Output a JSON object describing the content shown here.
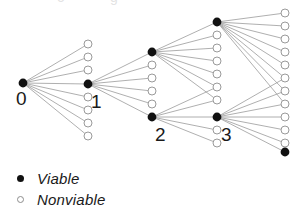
{
  "figure": {
    "type": "tree-diagram",
    "width": 293,
    "height": 217,
    "background": "#ffffff",
    "edge_color": "#9a9a9a",
    "viable_color": "#111111",
    "nonviable_stroke": "#9a9a9a",
    "nonviable_fill": "#ffffff"
  },
  "legend": {
    "items": [
      {
        "marker": "filled-dot",
        "label": "Viable"
      },
      {
        "marker": "open-dot",
        "label": "Nonviable"
      }
    ]
  },
  "node_labels": [
    {
      "text": "0",
      "x": 16,
      "y": 105
    },
    {
      "text": "1",
      "x": 91,
      "y": 108
    },
    {
      "text": "2",
      "x": 155,
      "y": 141
    },
    {
      "text": "3",
      "x": 221,
      "y": 141
    }
  ],
  "columns": [
    {
      "name": "root",
      "x": 23,
      "nodes": [
        {
          "y": 83,
          "viable": true,
          "label": "0"
        }
      ]
    },
    {
      "name": "depth-1",
      "x": 88,
      "nodes": [
        {
          "y": 44,
          "viable": false
        },
        {
          "y": 57,
          "viable": false
        },
        {
          "y": 70,
          "viable": false
        },
        {
          "y": 84,
          "viable": true,
          "label": "1"
        },
        {
          "y": 97,
          "viable": false
        },
        {
          "y": 110,
          "viable": false
        },
        {
          "y": 123,
          "viable": false
        },
        {
          "y": 136,
          "viable": false
        }
      ]
    },
    {
      "name": "depth-2",
      "x": 152,
      "nodes": [
        {
          "y": 52,
          "viable": true
        },
        {
          "y": 65,
          "viable": false
        },
        {
          "y": 78,
          "viable": false
        },
        {
          "y": 91,
          "viable": false
        },
        {
          "y": 104,
          "viable": false
        },
        {
          "y": 117,
          "viable": true,
          "label": "2"
        }
      ]
    },
    {
      "name": "depth-3",
      "x": 217,
      "nodes": [
        {
          "y": 22,
          "viable": true
        },
        {
          "y": 35,
          "viable": false
        },
        {
          "y": 48,
          "viable": false
        },
        {
          "y": 61,
          "viable": false
        },
        {
          "y": 74,
          "viable": false
        },
        {
          "y": 87,
          "viable": false
        },
        {
          "y": 100,
          "viable": false
        },
        {
          "y": 117,
          "viable": true,
          "label": "3"
        },
        {
          "y": 130,
          "viable": false
        },
        {
          "y": 143,
          "viable": false
        }
      ]
    },
    {
      "name": "depth-4",
      "x": 285,
      "nodes": [
        {
          "y": 13,
          "viable": false
        },
        {
          "y": 26,
          "viable": false
        },
        {
          "y": 39,
          "viable": false
        },
        {
          "y": 52,
          "viable": false
        },
        {
          "y": 65,
          "viable": false
        },
        {
          "y": 78,
          "viable": false
        },
        {
          "y": 91,
          "viable": false
        },
        {
          "y": 104,
          "viable": false
        },
        {
          "y": 117,
          "viable": false
        },
        {
          "y": 130,
          "viable": false
        },
        {
          "y": 143,
          "viable": false
        },
        {
          "y": 152,
          "viable": true
        }
      ]
    }
  ],
  "edges": [
    {
      "from": [
        23,
        83
      ],
      "to": [
        88,
        44
      ]
    },
    {
      "from": [
        23,
        83
      ],
      "to": [
        88,
        57
      ]
    },
    {
      "from": [
        23,
        83
      ],
      "to": [
        88,
        70
      ]
    },
    {
      "from": [
        23,
        83
      ],
      "to": [
        88,
        84
      ]
    },
    {
      "from": [
        23,
        83
      ],
      "to": [
        88,
        97
      ]
    },
    {
      "from": [
        23,
        83
      ],
      "to": [
        88,
        110
      ]
    },
    {
      "from": [
        23,
        83
      ],
      "to": [
        88,
        123
      ]
    },
    {
      "from": [
        23,
        83
      ],
      "to": [
        88,
        136
      ]
    },
    {
      "from": [
        88,
        84
      ],
      "to": [
        152,
        52
      ]
    },
    {
      "from": [
        88,
        84
      ],
      "to": [
        152,
        65
      ]
    },
    {
      "from": [
        88,
        84
      ],
      "to": [
        152,
        78
      ]
    },
    {
      "from": [
        88,
        84
      ],
      "to": [
        152,
        91
      ]
    },
    {
      "from": [
        88,
        84
      ],
      "to": [
        152,
        104
      ]
    },
    {
      "from": [
        88,
        84
      ],
      "to": [
        152,
        117
      ]
    },
    {
      "from": [
        152,
        52
      ],
      "to": [
        217,
        22
      ]
    },
    {
      "from": [
        152,
        52
      ],
      "to": [
        217,
        35
      ]
    },
    {
      "from": [
        152,
        52
      ],
      "to": [
        217,
        48
      ]
    },
    {
      "from": [
        152,
        52
      ],
      "to": [
        217,
        61
      ]
    },
    {
      "from": [
        152,
        52
      ],
      "to": [
        217,
        74
      ]
    },
    {
      "from": [
        152,
        52
      ],
      "to": [
        217,
        87
      ]
    },
    {
      "from": [
        152,
        52
      ],
      "to": [
        217,
        100
      ]
    },
    {
      "from": [
        152,
        117
      ],
      "to": [
        217,
        87
      ]
    },
    {
      "from": [
        152,
        117
      ],
      "to": [
        217,
        100
      ]
    },
    {
      "from": [
        152,
        117
      ],
      "to": [
        217,
        117
      ]
    },
    {
      "from": [
        152,
        117
      ],
      "to": [
        217,
        130
      ]
    },
    {
      "from": [
        152,
        117
      ],
      "to": [
        217,
        143
      ]
    },
    {
      "from": [
        217,
        22
      ],
      "to": [
        285,
        13
      ]
    },
    {
      "from": [
        217,
        22
      ],
      "to": [
        285,
        26
      ]
    },
    {
      "from": [
        217,
        22
      ],
      "to": [
        285,
        39
      ]
    },
    {
      "from": [
        217,
        22
      ],
      "to": [
        285,
        52
      ]
    },
    {
      "from": [
        217,
        22
      ],
      "to": [
        285,
        65
      ]
    },
    {
      "from": [
        217,
        22
      ],
      "to": [
        285,
        78
      ]
    },
    {
      "from": [
        217,
        22
      ],
      "to": [
        285,
        91
      ]
    },
    {
      "from": [
        217,
        22
      ],
      "to": [
        285,
        104
      ]
    },
    {
      "from": [
        217,
        117
      ],
      "to": [
        285,
        78
      ]
    },
    {
      "from": [
        217,
        117
      ],
      "to": [
        285,
        91
      ]
    },
    {
      "from": [
        217,
        117
      ],
      "to": [
        285,
        104
      ]
    },
    {
      "from": [
        217,
        117
      ],
      "to": [
        285,
        117
      ]
    },
    {
      "from": [
        217,
        117
      ],
      "to": [
        285,
        130
      ]
    },
    {
      "from": [
        217,
        117
      ],
      "to": [
        285,
        143
      ]
    },
    {
      "from": [
        217,
        117
      ],
      "to": [
        285,
        152
      ]
    }
  ]
}
